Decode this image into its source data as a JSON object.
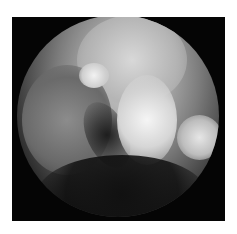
{
  "image": {
    "description": "Grayscale circular endoscopic view of tissue with a bright irregular lesion in the center on a black square background",
    "colors": {
      "background": "#ffffff",
      "frame": "#050505",
      "tissue_light": "#cfcfcf",
      "tissue_dark": "#4a4a4a"
    }
  }
}
